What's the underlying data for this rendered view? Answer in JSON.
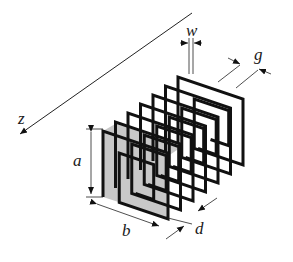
{
  "diagram": {
    "axis": {
      "label": "z"
    },
    "dimensions": {
      "height": "a",
      "width": "b",
      "period": "d",
      "strip_width": "w",
      "gap": "g"
    },
    "layers": 7,
    "colors": {
      "stroke": "#111111",
      "front_face_fill": "#c8c8c8",
      "background": "#ffffff"
    }
  }
}
